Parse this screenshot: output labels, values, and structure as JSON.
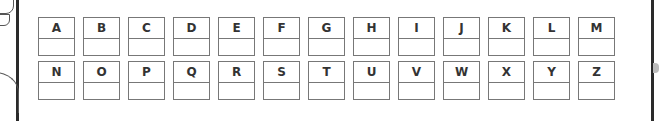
{
  "worksheet": {
    "rows": [
      [
        "A",
        "B",
        "C",
        "D",
        "E",
        "F",
        "G",
        "H",
        "I",
        "J",
        "K",
        "L",
        "M"
      ],
      [
        "N",
        "O",
        "P",
        "Q",
        "R",
        "S",
        "T",
        "U",
        "V",
        "W",
        "X",
        "Y",
        "Z"
      ]
    ]
  }
}
